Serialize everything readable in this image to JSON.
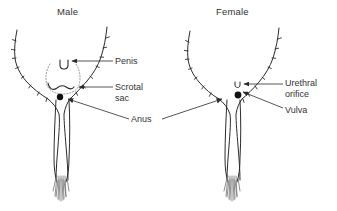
{
  "figure": {
    "type": "anatomical-line-diagram",
    "background_color": "#ffffff",
    "ink_color": "#2b2b2b",
    "panels": [
      {
        "id": "male",
        "title": "Male"
      },
      {
        "id": "female",
        "title": "Female"
      }
    ]
  },
  "titles": {
    "male": "Male",
    "female": "Female"
  },
  "labels": {
    "penis": "Penis",
    "scrotal_sac_line1": "Scrotal",
    "scrotal_sac_line2": "sac",
    "anus": "Anus",
    "urethral_orifice_line1": "Urethral",
    "urethral_orifice_line2": "orifice",
    "vulva": "Vulva"
  },
  "annotations": {
    "male_markers": [
      {
        "name": "penis-opening",
        "glyph": "U",
        "x": 64,
        "y": 64
      },
      {
        "name": "scrotal-sac-outline",
        "style": "dotted-oval",
        "x": 64,
        "y": 78
      },
      {
        "name": "scrotal-sac-fold",
        "style": "curved-line",
        "x": 64,
        "y": 88
      },
      {
        "name": "anus-dot",
        "style": "filled-circle",
        "x": 62,
        "y": 98
      }
    ],
    "female_markers": [
      {
        "name": "urethral-orifice",
        "glyph": "u",
        "x": 238,
        "y": 86
      },
      {
        "name": "vulva-dot",
        "style": "filled-circle",
        "x": 238,
        "y": 97
      }
    ],
    "leader_lines": [
      {
        "from": "penis-label",
        "to": "male-penis-opening",
        "arrow": true
      },
      {
        "from": "scrotal-sac-label",
        "to": "male-scrotal-fold",
        "arrow": true
      },
      {
        "from": "anus-label",
        "to": "male-anus-dot",
        "arrow": true
      },
      {
        "from": "anus-label",
        "to": "female-anus-dot",
        "arrow": true
      },
      {
        "from": "urethral-orifice-label",
        "to": "female-urethral-orifice",
        "arrow": true
      },
      {
        "from": "vulva-label",
        "to": "female-vulva-dot",
        "arrow": true
      }
    ]
  }
}
